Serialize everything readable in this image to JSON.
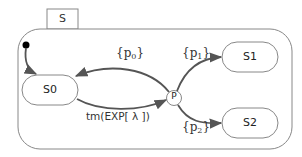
{
  "diagram": {
    "type": "state-machine",
    "container": {
      "label": "S"
    },
    "states": [
      {
        "id": "S0",
        "label": "S0"
      },
      {
        "id": "S1",
        "label": "S1"
      },
      {
        "id": "S2",
        "label": "S2"
      }
    ],
    "pseudostates": [
      {
        "id": "initial",
        "kind": "initial"
      },
      {
        "id": "P",
        "kind": "choice",
        "label": "P"
      }
    ],
    "transitions": [
      {
        "from": "initial",
        "to": "S0",
        "label": ""
      },
      {
        "from": "S0",
        "to": "P",
        "label": "tm(EXP[ λ ])"
      },
      {
        "from": "P",
        "to": "S0",
        "label_base": "{p",
        "label_sub": "0",
        "label_end": "}"
      },
      {
        "from": "P",
        "to": "S1",
        "label_base": "{p",
        "label_sub": "1",
        "label_end": "}"
      },
      {
        "from": "P",
        "to": "S2",
        "label_base": "{p",
        "label_sub": "2",
        "label_end": "}"
      }
    ]
  }
}
